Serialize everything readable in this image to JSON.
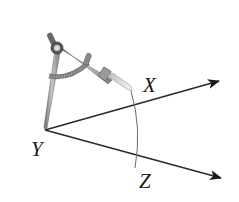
{
  "diagram": {
    "type": "geometry-construction",
    "labels": {
      "vertex": "Y",
      "ray_upper": "X",
      "ray_lower": "Z"
    },
    "points": {
      "Y": [
        45,
        130
      ],
      "X_arrow_tip": [
        219,
        81
      ],
      "Z_arrow_tip": [
        221,
        178
      ],
      "compass_pivot": [
        57,
        48
      ],
      "compass_pencil_tip": [
        132,
        91
      ]
    },
    "colors": {
      "line": "#2a2a2a",
      "arc": "#555555",
      "compass_metal": "#8a8a8a",
      "compass_dark": "#4a4a4a"
    }
  }
}
